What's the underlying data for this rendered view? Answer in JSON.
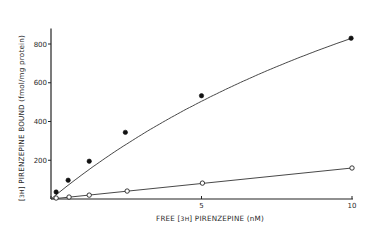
{
  "chart_data": {
    "type": "scatter",
    "title": "",
    "xlabel": "FREE [3H] PIRENZEPINE (nM)",
    "ylabel": "[3H] PIRENZEPINE BOUND (fmol/mg protein)",
    "xlabel_parts": {
      "prefix": "FREE",
      "bracket": "3H",
      "suffix": "PIRENZEPINE  (nM)"
    },
    "ylabel_parts": {
      "bracket": "3H",
      "suffix": "PIRENZEPINE  BOUND  (fmol/mg protein)"
    },
    "xlim": [
      0,
      10
    ],
    "ylim": [
      0,
      880
    ],
    "x_ticks": [
      {
        "value": 0,
        "label": ""
      },
      {
        "value": 5,
        "label": "5"
      },
      {
        "value": 10,
        "label": "10"
      }
    ],
    "y_ticks": [
      {
        "value": 200,
        "label": "200"
      },
      {
        "value": 400,
        "label": "400"
      },
      {
        "value": 600,
        "label": "600"
      },
      {
        "value": 800,
        "label": "800"
      }
    ],
    "grid": false,
    "legend": null,
    "series": [
      {
        "name": "filled circles (total binding)",
        "marker": "filled-circle",
        "fit": "curve",
        "x": [
          0.17,
          0.57,
          1.27,
          2.47,
          5.0,
          9.97
        ],
        "y": [
          36,
          97,
          195,
          344,
          533,
          830
        ]
      },
      {
        "name": "open circles (nonspecific binding)",
        "marker": "open-circle",
        "fit": "line",
        "x": [
          0.17,
          0.6,
          1.27,
          2.53,
          5.03,
          10.0
        ],
        "y": [
          5,
          10,
          20,
          41,
          82,
          160
        ]
      }
    ]
  }
}
